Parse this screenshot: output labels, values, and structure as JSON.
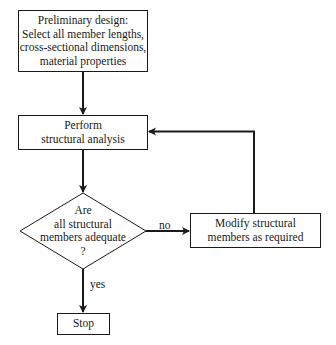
{
  "diagram": {
    "type": "flowchart",
    "nodes": {
      "preliminary_design": {
        "shape": "rectangle",
        "lines": [
          "Preliminary design:",
          "Select all member lengths,",
          "cross-sectional dimensions,",
          "material properties"
        ]
      },
      "structural_analysis": {
        "shape": "rectangle",
        "lines": [
          "Perform",
          "structural analysis"
        ]
      },
      "decision": {
        "shape": "diamond",
        "lines": [
          "Are",
          "all structural",
          "members adequate",
          "?"
        ]
      },
      "modify": {
        "shape": "rectangle",
        "lines": [
          "Modify structural",
          "members as required"
        ]
      },
      "stop": {
        "shape": "rectangle",
        "lines": [
          "Stop"
        ]
      }
    },
    "edges": {
      "no_label": "no",
      "yes_label": "yes"
    },
    "colors": {
      "stroke": "#1a1a1a",
      "background": "#ffffff"
    }
  }
}
